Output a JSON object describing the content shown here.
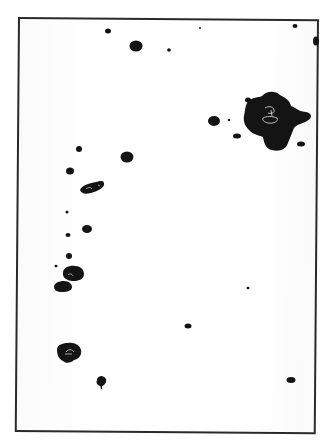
{
  "figure": {
    "frame": {
      "left": 18,
      "top": 17,
      "right": 320,
      "bottom": 434,
      "stroke": "#2a2a2a"
    },
    "background_color": "#ffffff",
    "spot_color": "#141414",
    "spots": [
      {
        "x": 108,
        "y": 31,
        "rx": 3,
        "ry": 2.5
      },
      {
        "x": 136,
        "y": 46,
        "rx": 6.5,
        "ry": 5.5
      },
      {
        "x": 169,
        "y": 50,
        "rx": 1.8,
        "ry": 1.8
      },
      {
        "x": 200,
        "y": 28,
        "rx": 1,
        "ry": 1
      },
      {
        "x": 295,
        "y": 26,
        "rx": 2.5,
        "ry": 2
      },
      {
        "x": 316,
        "y": 41,
        "rx": 3,
        "ry": 4.5
      },
      {
        "x": 214,
        "y": 121,
        "rx": 6,
        "ry": 5
      },
      {
        "x": 229,
        "y": 120,
        "rx": 1.2,
        "ry": 1.2
      },
      {
        "x": 237,
        "y": 136,
        "rx": 4,
        "ry": 2.5
      },
      {
        "x": 301,
        "y": 144,
        "rx": 4,
        "ry": 2.5
      },
      {
        "x": 79,
        "y": 149,
        "rx": 3,
        "ry": 3
      },
      {
        "x": 127,
        "y": 157,
        "rx": 6.5,
        "ry": 5.5
      },
      {
        "x": 70,
        "y": 171,
        "rx": 4,
        "ry": 3.5
      },
      {
        "x": 67,
        "y": 212,
        "rx": 1.5,
        "ry": 1.5
      },
      {
        "x": 87,
        "y": 229,
        "rx": 5,
        "ry": 4
      },
      {
        "x": 68,
        "y": 235,
        "rx": 2.5,
        "ry": 2
      },
      {
        "x": 69,
        "y": 256,
        "rx": 3,
        "ry": 3
      },
      {
        "x": 56,
        "y": 266,
        "rx": 1.5,
        "ry": 1.2
      },
      {
        "x": 248,
        "y": 288,
        "rx": 1.5,
        "ry": 1.2
      },
      {
        "x": 188,
        "y": 326,
        "rx": 3.5,
        "ry": 2.5
      },
      {
        "x": 101,
        "y": 382,
        "rx": 4.5,
        "ry": 4
      },
      {
        "x": 291,
        "y": 380,
        "rx": 4.5,
        "ry": 3
      }
    ]
  }
}
